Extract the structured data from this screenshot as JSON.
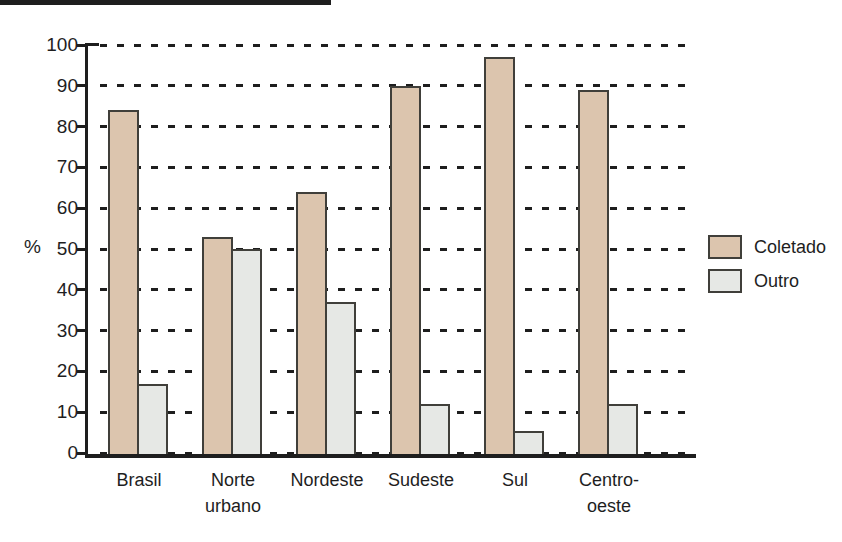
{
  "figure": {
    "background": "#ffffff"
  },
  "palette": {
    "ink": "#1e1e1e",
    "bar_border": "#403f3a",
    "coletado_fill": "#dcc5ae",
    "outro_fill": "#e6e8e5"
  },
  "chart_data": {
    "type": "bar",
    "title": "",
    "xlabel": "",
    "ylabel": "%",
    "categories": [
      "Brasil",
      "Norte\nurbano",
      "Nordeste",
      "Sudeste",
      "Sul",
      "Centro-\noeste"
    ],
    "series": [
      {
        "name": "Coletado",
        "color_key": "coletado_fill",
        "values": [
          84,
          53,
          64,
          90,
          97,
          89
        ]
      },
      {
        "name": "Outro",
        "color_key": "outro_fill",
        "values": [
          17,
          50,
          37,
          12,
          5.5,
          12
        ]
      }
    ],
    "y_ticks": [
      0,
      10,
      20,
      30,
      40,
      50,
      60,
      70,
      80,
      90,
      100
    ],
    "ylim": [
      0,
      100
    ],
    "grid": "dashed-horizontal",
    "legend_position": "right"
  }
}
